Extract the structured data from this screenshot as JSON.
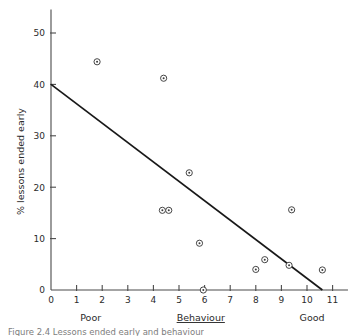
{
  "chart_data": {
    "type": "scatter",
    "title": "",
    "xlabel": "Behaviour",
    "ylabel": "% lessons ended early",
    "xlim": [
      0,
      11.6
    ],
    "ylim": [
      0,
      53
    ],
    "xticks": [
      "0",
      "1",
      "2",
      "3",
      "4",
      "5",
      "6",
      "7",
      "8",
      "9",
      "10",
      "11"
    ],
    "xtick_values": [
      0,
      1,
      2,
      3,
      4,
      5,
      6,
      7,
      8,
      9,
      10,
      11
    ],
    "yticks": [
      "0",
      "10",
      "20",
      "30",
      "40",
      "50"
    ],
    "ytick_values": [
      0,
      10,
      20,
      30,
      40,
      50
    ],
    "grid": false,
    "legend": null,
    "x_axis_low_anchor": "Poor",
    "x_axis_high_anchor": "Good",
    "marker_style": "open-circle-with-dot",
    "points": [
      {
        "x": 1.8,
        "y": 44.4
      },
      {
        "x": 4.4,
        "y": 41.2
      },
      {
        "x": 5.4,
        "y": 22.8
      },
      {
        "x": 4.35,
        "y": 15.5
      },
      {
        "x": 4.6,
        "y": 15.5
      },
      {
        "x": 5.8,
        "y": 9.1
      },
      {
        "x": 5.95,
        "y": 0.0
      },
      {
        "x": 8.0,
        "y": 4.0
      },
      {
        "x": 8.35,
        "y": 5.9
      },
      {
        "x": 9.3,
        "y": 4.8
      },
      {
        "x": 9.4,
        "y": 15.6
      },
      {
        "x": 10.6,
        "y": 3.9
      }
    ],
    "trend_line": {
      "label": "regression line",
      "x_start": 0.0,
      "y_start": 40.0,
      "x_end": 10.6,
      "y_end": 0.0
    }
  },
  "caption": {
    "text": "Figure 2.4  Lessons ended early and behaviour"
  }
}
